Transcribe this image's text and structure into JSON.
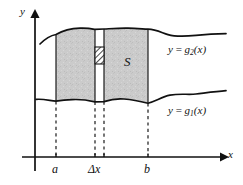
{
  "figure": {
    "axes": {
      "y_label": "y",
      "x_label": "x",
      "x_axis_y": 157,
      "y_axis_x": 35
    },
    "ticks": [
      {
        "name": "a",
        "label": "a",
        "x": 56
      },
      {
        "name": "delta-x",
        "label": "Δx",
        "x": 99
      },
      {
        "name": "b",
        "label": "b",
        "x": 148
      }
    ],
    "region": {
      "name": "S",
      "label": "S",
      "fill_color": "#c9c9c9",
      "edge_color": "#1a1a1a",
      "left_bound": 56,
      "right_bound": 148
    },
    "strip": {
      "label": "Δx",
      "left": 95,
      "right": 104,
      "fill_color": "#ffffff"
    },
    "patch": {
      "name": "hatched-element",
      "hatch": "diagonal",
      "left": 95,
      "right": 104,
      "top": 47,
      "bottom": 64,
      "fill_color": "#ffffff",
      "line_color": "#1a1a1a"
    },
    "curves": [
      {
        "name": "upper-curve",
        "label_y": "y",
        "label_eq": "=",
        "label_fn": "g",
        "label_sub": "2",
        "label_arg": "(x)",
        "label_full": "y = g₂(x)"
      },
      {
        "name": "lower-curve",
        "label_y": "y",
        "label_eq": "=",
        "label_fn": "g",
        "label_sub": "1",
        "label_arg": "(x)",
        "label_full": "y = g₁(x)"
      }
    ],
    "dashed_guides": [
      56,
      95,
      104,
      148
    ]
  }
}
